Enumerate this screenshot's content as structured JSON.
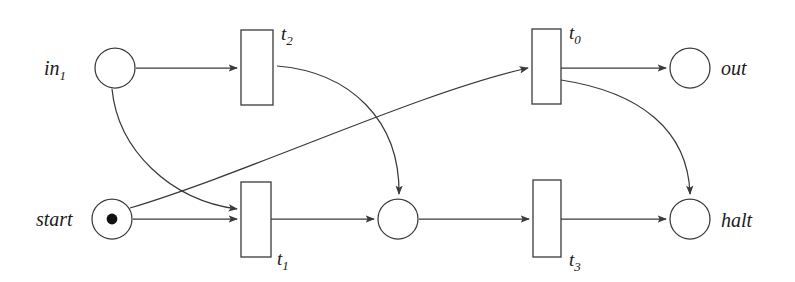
{
  "diagram": {
    "kind": "petri-net",
    "background_color": "#ffffff",
    "stroke_color": "#3a3a3a",
    "text_color": "#1a1a1a",
    "token_color": "#111111",
    "places": [
      {
        "id": "in1",
        "label_base": "in",
        "label_sub": "1",
        "label_full": "in₁",
        "cx": 115,
        "cy": 68,
        "r": 20,
        "tokens": 0,
        "label_x": 44,
        "label_y": 75,
        "label_anchor": "start"
      },
      {
        "id": "out",
        "label_base": "out",
        "label_sub": "",
        "label_full": "out",
        "cx": 690,
        "cy": 68,
        "r": 20,
        "tokens": 0,
        "label_x": 721,
        "label_y": 75,
        "label_anchor": "start"
      },
      {
        "id": "start",
        "label_base": "start",
        "label_sub": "",
        "label_full": "start",
        "cx": 112,
        "cy": 219,
        "r": 20,
        "tokens": 1,
        "label_x": 36,
        "label_y": 226,
        "label_anchor": "start"
      },
      {
        "id": "mid",
        "label_base": "",
        "label_sub": "",
        "label_full": "",
        "cx": 398,
        "cy": 219,
        "r": 20,
        "tokens": 0,
        "label_x": 398,
        "label_y": 219,
        "label_anchor": "middle"
      },
      {
        "id": "halt",
        "label_base": "halt",
        "label_sub": "",
        "label_full": "halt",
        "cx": 690,
        "cy": 219,
        "r": 20,
        "tokens": 0,
        "label_x": 721,
        "label_y": 227,
        "label_anchor": "start"
      }
    ],
    "transitions": [
      {
        "id": "t2",
        "label_base": "t",
        "label_sub": "2",
        "label_full": "t₂",
        "x": 241,
        "y": 30,
        "w": 32,
        "h": 75,
        "label_x": 281,
        "label_y": 40
      },
      {
        "id": "t0",
        "label_base": "t",
        "label_sub": "0",
        "label_full": "t₀",
        "x": 532,
        "y": 29,
        "w": 29,
        "h": 75,
        "label_x": 569,
        "label_y": 39
      },
      {
        "id": "t1",
        "label_base": "t",
        "label_sub": "1",
        "label_full": "t₁",
        "x": 241,
        "y": 182,
        "w": 30,
        "h": 75,
        "label_x": 277,
        "label_y": 265
      },
      {
        "id": "t3",
        "label_base": "t",
        "label_sub": "3",
        "label_full": "t₃",
        "x": 533,
        "y": 180,
        "w": 28,
        "h": 77,
        "label_x": 569,
        "label_y": 266
      }
    ],
    "arcs": [
      {
        "id": "arc-in1-t2",
        "from": "in1",
        "to": "t2",
        "shape": "straight",
        "d": "M 136 68 L 237 68"
      },
      {
        "id": "arc-in1-t1",
        "from": "in1",
        "to": "t1",
        "shape": "curved",
        "d": "M 112 89 C 118 150 170 200 237 209"
      },
      {
        "id": "arc-start-t1",
        "from": "start",
        "to": "t1",
        "shape": "straight",
        "d": "M 133 219 L 237 219"
      },
      {
        "id": "arc-start-t0",
        "from": "start",
        "to": "t0",
        "shape": "curved",
        "d": "M 130 208 C 250 172 420 92 528 68"
      },
      {
        "id": "arc-t2-mid",
        "from": "t2",
        "to": "mid",
        "shape": "curved",
        "d": "M 277 66 C 350 72 400 120 399 194"
      },
      {
        "id": "arc-t0-out",
        "from": "t0",
        "to": "out",
        "shape": "straight",
        "d": "M 561 68 L 666 68"
      },
      {
        "id": "arc-t0-halt",
        "from": "t0",
        "to": "halt",
        "shape": "curved",
        "d": "M 561 80 C 640 92 688 130 690 194"
      },
      {
        "id": "arc-t1-mid",
        "from": "t1",
        "to": "mid",
        "shape": "straight",
        "d": "M 271 219 L 374 219"
      },
      {
        "id": "arc-mid-t3",
        "from": "mid",
        "to": "t3",
        "shape": "straight",
        "d": "M 419 219 L 529 219"
      },
      {
        "id": "arc-t3-halt",
        "from": "t3",
        "to": "halt",
        "shape": "straight",
        "d": "M 561 219 L 666 219"
      }
    ]
  }
}
